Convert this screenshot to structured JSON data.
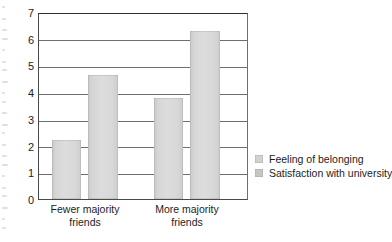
{
  "chart_data": {
    "type": "bar",
    "title": "",
    "subtitle": "",
    "xlabel": "",
    "ylabel": "",
    "categories": [
      "Fewer majority\nfriends",
      "More majority\nfriends"
    ],
    "series": [
      {
        "name": "Feeling of belonging",
        "values": [
          2.2,
          3.8
        ],
        "color": "#d4d4d4"
      },
      {
        "name": "Satisfaction with university",
        "values": [
          4.65,
          6.3
        ],
        "color": "#cccccc"
      }
    ],
    "ylim": [
      0,
      7
    ],
    "ytick_labels": [
      "0",
      "1",
      "2",
      "3",
      "4",
      "5",
      "6",
      "7"
    ],
    "yticks": [
      0,
      1,
      2,
      3,
      4,
      5,
      6,
      7
    ],
    "grid": "horizontal",
    "legend_position": "right",
    "annotations": []
  },
  "legend": {
    "items": [
      {
        "label": "Feeling of belonging",
        "swatch": "legend-swatch-belonging"
      },
      {
        "label": "Satisfaction with university",
        "swatch": "legend-swatch-satisfaction"
      }
    ]
  },
  "axes": {
    "y_tick_0": "0",
    "y_tick_1": "1",
    "y_tick_2": "2",
    "y_tick_3": "3",
    "y_tick_4": "4",
    "y_tick_5": "5",
    "y_tick_6": "6",
    "y_tick_7": "7"
  },
  "categories": {
    "cat_0": "Fewer majority\nfriends",
    "cat_1": "More majority\nfriends"
  },
  "colors": {
    "bar_fill": "#d6d6d6",
    "axis": "#4a4a4a",
    "grid": "#6f6f6f",
    "text": "#1d1d1d"
  }
}
